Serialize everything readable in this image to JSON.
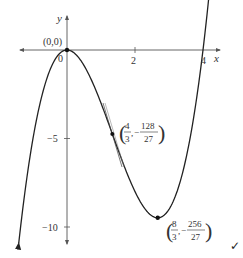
{
  "chart_data": {
    "type": "line",
    "function": "y = x^3 - 4x^2",
    "xlabel": "x",
    "ylabel": "y",
    "x_ticks": [
      {
        "value": 0,
        "label": "0"
      },
      {
        "value": 2,
        "label": "2"
      },
      {
        "value": 4,
        "label": "4"
      }
    ],
    "y_ticks": [
      {
        "value": -5,
        "label": "−5"
      },
      {
        "value": -10,
        "label": "−10"
      }
    ],
    "xlim": [
      -1.9,
      4.9
    ],
    "ylim": [
      -11.5,
      2.5
    ],
    "grid": false,
    "annotated_points": [
      {
        "x": 0,
        "y": 0,
        "label": "(0,0)",
        "kind": "local maximum"
      },
      {
        "x": 1.3333,
        "y": -4.7407,
        "label_num_x": "4",
        "label_den_x": "3",
        "label_num_y": "128",
        "label_den_y": "27",
        "kind": "point of inflection",
        "tangent": true
      },
      {
        "x": 2.6667,
        "y": -9.4815,
        "label_num_x": "8",
        "label_den_x": "3",
        "label_num_y": "256",
        "label_den_y": "27",
        "kind": "local minimum"
      }
    ]
  },
  "labels": {
    "x_axis": "x",
    "y_axis": "y",
    "origin_point": "(0,0)",
    "origin_tick": "0",
    "x_tick_2": "2",
    "x_tick_4": "4",
    "y_tick_m5": "−5",
    "y_tick_m10": "−10",
    "infl_x_num": "4",
    "infl_x_den": "3",
    "infl_y_num": "128",
    "infl_y_den": "27",
    "min_x_num": "8",
    "min_x_den": "3",
    "min_y_num": "256",
    "min_y_den": "27",
    "minus": "−",
    "comma": ",",
    "checkmark": "✓"
  },
  "colors": {
    "curve": "#222222",
    "axes": "#555555",
    "text": "#333333"
  }
}
